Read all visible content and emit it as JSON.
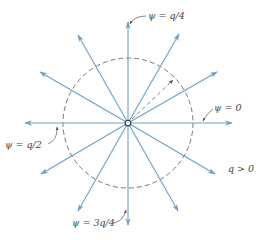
{
  "diagram": {
    "type": "radial-field-lines",
    "center": {
      "x": 128,
      "y": 123
    },
    "circle_radius": 65,
    "ray_angles_deg": [
      0,
      30,
      60,
      90,
      120,
      150,
      180,
      210,
      240,
      270,
      300,
      330
    ],
    "ray_color": "#6f9fc8",
    "circle_color": "#555555",
    "labels": {
      "psi_q4": "ψ = q/4",
      "psi_0": "ψ = 0",
      "psi_q2": "ψ = q/2",
      "psi_3q4": "ψ = 3q/4",
      "q_positive": "q > 0"
    }
  }
}
